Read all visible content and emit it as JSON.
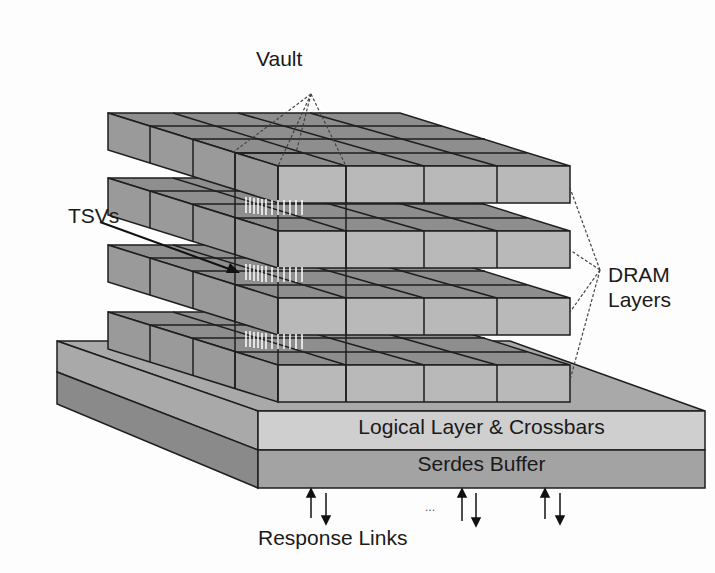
{
  "diagram": {
    "labels": {
      "vault": "Vault",
      "tsvs": "TSVs",
      "dram_line1": "DRAM",
      "dram_line2": "Layers",
      "logical_layer": "Logical Layer & Crossbars",
      "serdes_buffer": "Serdes Buffer",
      "response_links": "Response Links",
      "ellipsis": "..."
    },
    "dram_layer_count": 4,
    "vault_grid": "4x4",
    "colors": {
      "top_face": "#8e8e8e",
      "front_face": "#b9b9b9",
      "side_face": "#9a9a9a",
      "logical_front": "#cfcfcf",
      "serdes_front": "#a3a3a3",
      "base_side_top": "#a9a9a9",
      "base_side_bottom": "#8a8a8a",
      "outline": "#1e1e1e"
    }
  }
}
